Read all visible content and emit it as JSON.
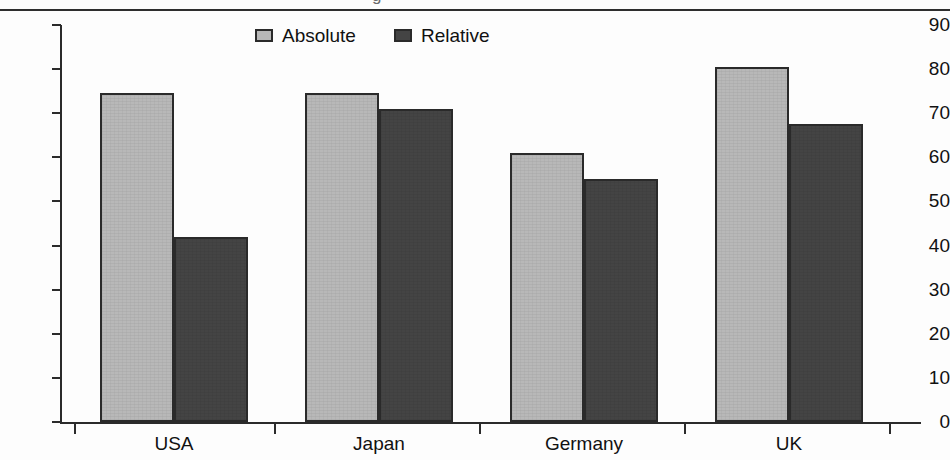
{
  "page": {
    "cut_off_text_above": "g",
    "colors": {
      "absolute_fill": "#b8b8b8",
      "relative_fill": "#444444",
      "axis": "#2b2b2b",
      "background": "#fdfdfd"
    }
  },
  "legend": {
    "position": "top-center",
    "items": [
      {
        "label": "Absolute",
        "color": "#b8b8b8"
      },
      {
        "label": "Relative",
        "color": "#444444"
      }
    ]
  },
  "axes": {
    "y_ticks": [
      "0",
      "10",
      "20",
      "30",
      "40",
      "50",
      "60",
      "70",
      "80",
      "90"
    ],
    "x_categories": [
      "USA",
      "Japan",
      "Germany",
      "UK"
    ]
  },
  "chart_data": {
    "type": "bar",
    "title": "",
    "subtitle": "",
    "xlabel": "",
    "ylabel": "",
    "categories": [
      "USA",
      "Japan",
      "Germany",
      "UK"
    ],
    "series": [
      {
        "name": "Absolute",
        "color": "#b8b8b8",
        "values": [
          74.5,
          74.5,
          61.0,
          80.5
        ]
      },
      {
        "name": "Relative",
        "color": "#444444",
        "values": [
          42.0,
          71.0,
          55.0,
          67.5
        ]
      }
    ],
    "ylim": [
      0,
      90
    ],
    "ytick_step": 10,
    "grid": false,
    "legend_position": "top-center",
    "orientation": "vertical",
    "grouping": "grouped"
  }
}
